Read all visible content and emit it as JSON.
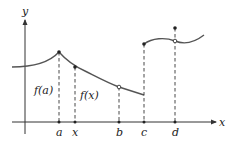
{
  "diagram": {
    "axes": {
      "x_label": "x",
      "y_label": "y"
    },
    "x_ticks": [
      {
        "label": "a",
        "px": 59
      },
      {
        "label": "x",
        "px": 75
      },
      {
        "label": "b",
        "px": 119
      },
      {
        "label": "c",
        "px": 144
      },
      {
        "label": "d",
        "px": 175
      }
    ],
    "annotations": {
      "f_a": "f(a)",
      "f_x": "f(x)"
    },
    "points": {
      "peak_a": {
        "x": 59,
        "y": 52,
        "type": "filled"
      },
      "point_x": {
        "x": 75,
        "y": 67,
        "type": "filled"
      },
      "hole_b": {
        "x": 119,
        "y": 87,
        "type": "open"
      },
      "start_c": {
        "x": 144,
        "y": 44,
        "type": "filled"
      },
      "hole_d": {
        "x": 175,
        "y": 41,
        "type": "open"
      },
      "value_d": {
        "x": 175,
        "y": 28,
        "type": "filled"
      }
    },
    "colors": {
      "curve": "#555555",
      "axis": "#333333",
      "text": "#222222"
    }
  }
}
